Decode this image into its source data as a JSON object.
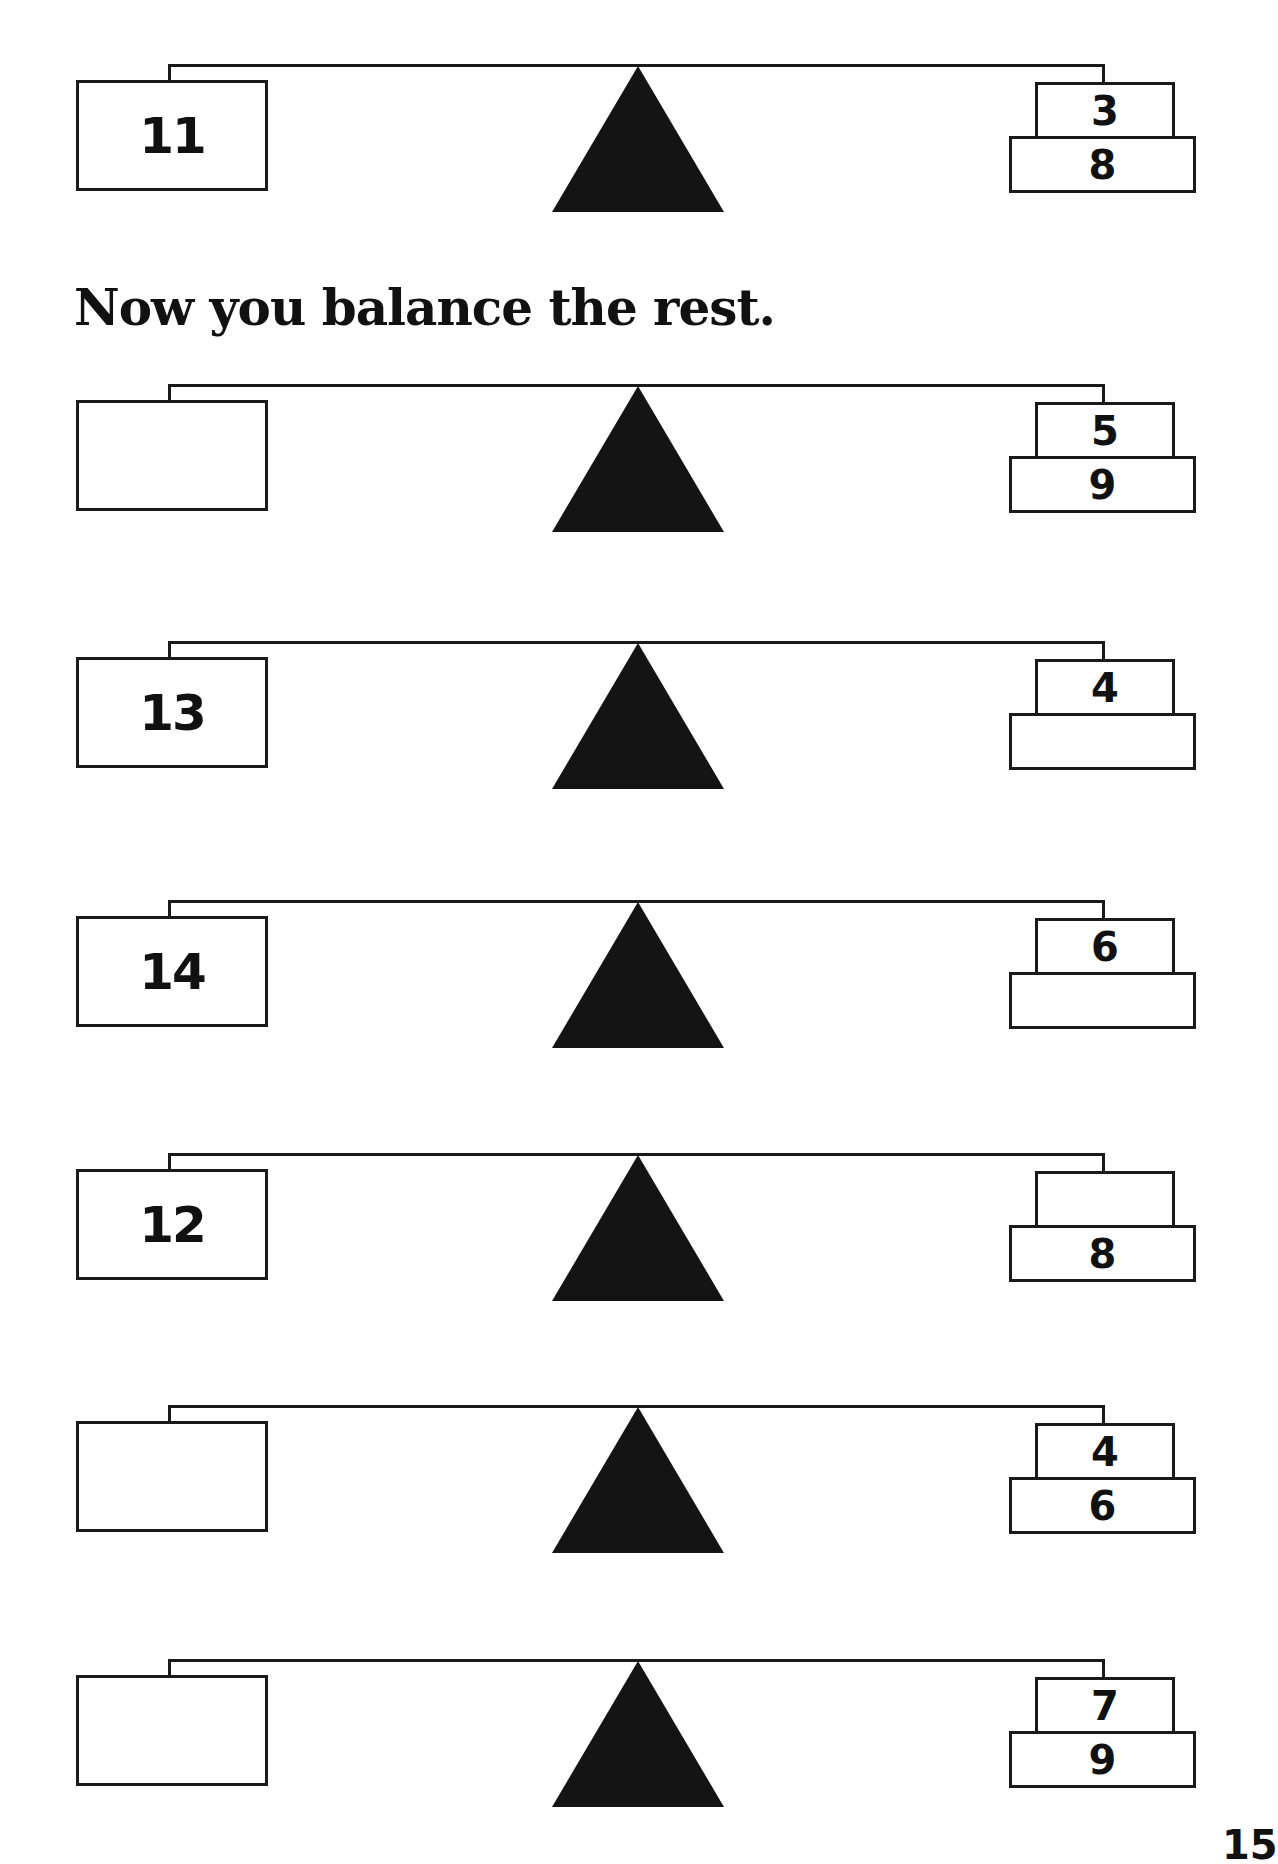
{
  "heading": "Now you balance the rest.",
  "page_number": "15",
  "scales": [
    {
      "id": "example",
      "left": "11",
      "top": "3",
      "bottom": "8",
      "y": 60
    },
    {
      "id": "problem-1",
      "left": "",
      "top": "5",
      "bottom": "9",
      "y": 380
    },
    {
      "id": "problem-2",
      "left": "13",
      "top": "4",
      "bottom": "",
      "y": 637
    },
    {
      "id": "problem-3",
      "left": "14",
      "top": "6",
      "bottom": "",
      "y": 896
    },
    {
      "id": "problem-4",
      "left": "12",
      "top": "",
      "bottom": "8",
      "y": 1149
    },
    {
      "id": "problem-5",
      "left": "",
      "top": "4",
      "bottom": "6",
      "y": 1401
    },
    {
      "id": "problem-6",
      "left": "",
      "top": "7",
      "bottom": "9",
      "y": 1655
    }
  ]
}
